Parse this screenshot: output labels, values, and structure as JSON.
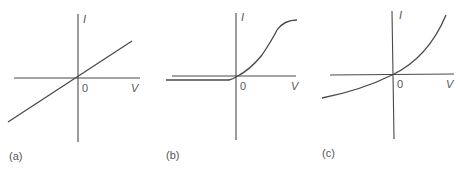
{
  "panels": [
    {
      "id": "a",
      "caption": "(a)",
      "y_label": "I",
      "x_label": "V",
      "origin_label": "0",
      "shape": "linear"
    },
    {
      "id": "b",
      "caption": "(b)",
      "y_label": "I",
      "x_label": "V",
      "origin_label": "0",
      "shape": "diode-saturating"
    },
    {
      "id": "c",
      "caption": "(c)",
      "y_label": "I",
      "x_label": "V",
      "origin_label": "0",
      "shape": "exponential"
    }
  ],
  "colors": {
    "line": "#4a4a4a",
    "text": "#555555",
    "background": "#ffffff"
  }
}
